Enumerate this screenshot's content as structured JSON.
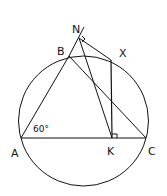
{
  "diagram": {
    "type": "geometry",
    "stroke_color": "#111111",
    "background": "#ffffff",
    "circle": {
      "cx": 83.5,
      "cy": 121,
      "r": 65
    },
    "points": {
      "A": {
        "label": "A",
        "x": 21,
        "y": 138
      },
      "B": {
        "label": "B",
        "x": 69,
        "y": 56
      },
      "C": {
        "label": "C",
        "x": 146,
        "y": 138
      },
      "K": {
        "label": "K",
        "x": 112,
        "y": 138
      },
      "X": {
        "label": "X",
        "x": 111,
        "y": 60
      },
      "N": {
        "label": "N",
        "x": 79,
        "y": 38
      }
    },
    "angle_label": "60°",
    "right_angles": [
      "N",
      "K"
    ]
  }
}
